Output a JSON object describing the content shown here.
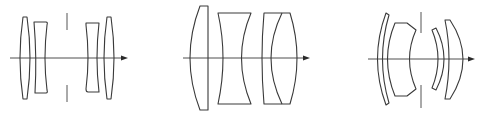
{
  "figure": {
    "colors": {
      "background": "#ffffff",
      "line": "#3a3a3a"
    },
    "diagrams": [
      {
        "id": "diagram-1",
        "type": "double-gauss-symmetric",
        "elements": [
          "biconvex",
          "biconcave",
          "aperture-stop",
          "biconcave",
          "biconvex"
        ],
        "element_count": 4,
        "has_aperture_stop": true
      },
      {
        "id": "diagram-2",
        "type": "triplet-variant",
        "elements": [
          "plano-convex",
          "biconcave",
          "cemented-doublet"
        ],
        "element_count": 4,
        "has_aperture_stop": false
      },
      {
        "id": "diagram-3",
        "type": "meniscus-group",
        "elements": [
          "meniscus",
          "thick-meniscus",
          "aperture-stop",
          "meniscus",
          "meniscus"
        ],
        "element_count": 4,
        "has_aperture_stop": true
      }
    ]
  }
}
